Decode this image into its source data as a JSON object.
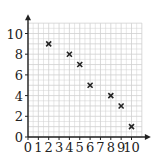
{
  "chart_data": {
    "type": "scatter",
    "title": "",
    "xlabel": "",
    "ylabel": "",
    "xlim": [
      0,
      11
    ],
    "ylim": [
      0,
      11
    ],
    "grid": true,
    "marker": "x",
    "x_ticks": [
      "0",
      "1",
      "2",
      "3",
      "4",
      "5",
      "6",
      "7",
      "8",
      "9",
      "10"
    ],
    "y_ticks": [
      "0",
      "2",
      "4",
      "6",
      "8",
      "10"
    ],
    "points": [
      {
        "x": 2,
        "y": 9
      },
      {
        "x": 4,
        "y": 8
      },
      {
        "x": 5,
        "y": 7
      },
      {
        "x": 6,
        "y": 5
      },
      {
        "x": 8,
        "y": 4
      },
      {
        "x": 9,
        "y": 3
      },
      {
        "x": 10,
        "y": 1
      }
    ],
    "colors": {
      "grid": "#cfcfcf",
      "axis": "#222222",
      "marker": "#222222"
    }
  }
}
